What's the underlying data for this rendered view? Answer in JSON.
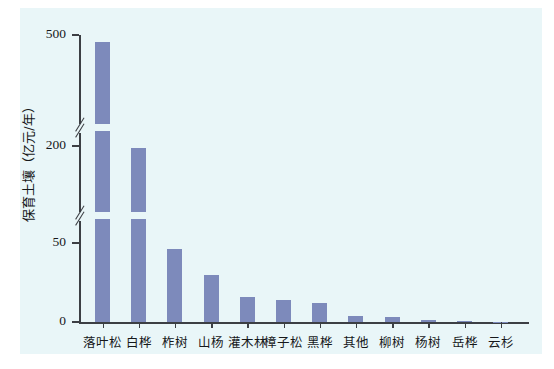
{
  "chart_data": {
    "type": "bar",
    "title": "",
    "subtitle": "",
    "xlabel": "",
    "ylabel": "保育土壤（亿元/年）",
    "categories": [
      "落叶松",
      "白桦",
      "柞树",
      "山杨",
      "灌木林",
      "樟子松",
      "黑桦",
      "其他",
      "柳树",
      "杨树",
      "岳桦",
      "云杉"
    ],
    "values": [
      480,
      197,
      46,
      30,
      16,
      14,
      12,
      3.5,
      3,
      1.5,
      0.5,
      0.2
    ],
    "series": [
      {
        "name": "保育土壤",
        "values": [
          480,
          197,
          46,
          30,
          16,
          14,
          12,
          3.5,
          3,
          1.5,
          0.5,
          0.2
        ]
      }
    ],
    "ytick_labels": [
      "0",
      "50",
      "200",
      "500"
    ],
    "ytick_values": [
      0,
      50,
      200,
      500
    ],
    "ylim": [
      0,
      500
    ],
    "axis_breaks": [
      {
        "between": [
          50,
          200
        ]
      },
      {
        "between": [
          200,
          500
        ]
      }
    ],
    "grid": false,
    "legend": false,
    "legend_position": "none",
    "bar_color": "#7d8abb",
    "plot_background_color": "#e9f6f8",
    "axis_color": "#3c3f44",
    "figure_background_color": "#ffffff",
    "annotations": []
  }
}
